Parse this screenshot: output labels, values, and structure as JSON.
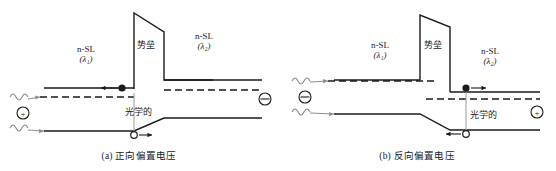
{
  "figure": {
    "title": "",
    "panels": [
      {
        "id": "a",
        "caption": "(a) 正向偏置电压",
        "caption_meaning": "Forward bias voltage",
        "barrier_label": "势垒",
        "optical_label": "光学的",
        "left_region": {
          "material": "n-SL",
          "wavelength": "(λ₁)"
        },
        "right_region": {
          "material": "n-SL",
          "wavelength": "(λ₂)"
        },
        "left_charge_symbol": "⊕",
        "right_charge_symbol": "⊖",
        "electron_marker": "filled-circle",
        "electron_arrow_direction": "left",
        "hole_marker": "open-circle",
        "hole_arrow_direction": "right",
        "photon_count": 2
      },
      {
        "id": "b",
        "caption": "(b) 反向偏置电压",
        "caption_meaning": "Reverse bias voltage",
        "barrier_label": "势垒",
        "optical_label": "光学的",
        "left_region": {
          "material": "n-SL",
          "wavelength": "(λ₁)"
        },
        "right_region": {
          "material": "n-SL",
          "wavelength": "(λ₂)"
        },
        "left_charge_symbol": "⊖",
        "right_charge_symbol": "⊕",
        "electron_marker": "filled-circle",
        "electron_arrow_direction": "right",
        "hole_marker": "open-circle",
        "hole_arrow_direction": "left",
        "photon_count": 2
      }
    ],
    "colors": {
      "line": "#1a1a1a",
      "background": "#ffffff",
      "photon": "#8c8c8c",
      "guide": "#9a9a9a"
    }
  }
}
